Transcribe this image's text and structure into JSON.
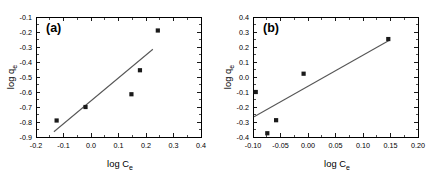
{
  "figure": {
    "background": "#ffffff",
    "panel_count": 2
  },
  "chart_data": [
    {
      "type": "scatter",
      "panel_label": "(a)",
      "title": "",
      "xlabel": "log C",
      "xlabel_sub": "e",
      "ylabel": "log q",
      "ylabel_sub": "e",
      "xlim": [
        -0.2,
        0.4
      ],
      "ylim": [
        -0.9,
        -0.1
      ],
      "xticks": [
        -0.2,
        -0.1,
        0.0,
        0.1,
        0.2,
        0.3,
        0.4
      ],
      "xticklabels": [
        "-0.2",
        "-0.1",
        "0.0",
        "0.1",
        "0.2",
        "0.3",
        "0.4"
      ],
      "yticks": [
        -0.9,
        -0.8,
        -0.7,
        -0.6,
        -0.5,
        -0.4,
        -0.3,
        -0.2,
        -0.1
      ],
      "yticklabels": [
        "-0.9",
        "-0.8",
        "-0.7",
        "-0.6",
        "-0.5",
        "-0.4",
        "-0.3",
        "-0.2",
        "-0.1"
      ],
      "grid": false,
      "legend": null,
      "marker_color": "#1a1a1a",
      "marker_shape": "square",
      "line_color": "#555555",
      "points": [
        {
          "x": -0.125,
          "y": -0.79
        },
        {
          "x": -0.02,
          "y": -0.7
        },
        {
          "x": 0.147,
          "y": -0.615
        },
        {
          "x": 0.178,
          "y": -0.455
        },
        {
          "x": 0.243,
          "y": -0.19
        }
      ],
      "fit_line": {
        "x1": -0.135,
        "y1": -0.865,
        "x2": 0.225,
        "y2": -0.315
      }
    },
    {
      "type": "scatter",
      "panel_label": "(b)",
      "title": "",
      "xlabel": "log C",
      "xlabel_sub": "e",
      "ylabel": "log q",
      "ylabel_sub": "e",
      "xlim": [
        -0.1,
        0.2
      ],
      "ylim": [
        -0.4,
        0.4
      ],
      "xticks": [
        -0.1,
        -0.05,
        0.0,
        0.05,
        0.1,
        0.15,
        0.2
      ],
      "xticklabels": [
        "-0.10",
        "-0.05",
        "0.00",
        "0.05",
        "0.10",
        "0.15",
        "0.20"
      ],
      "yticks": [
        -0.4,
        -0.3,
        -0.2,
        -0.1,
        0.0,
        0.1,
        0.2,
        0.3,
        0.4
      ],
      "yticklabels": [
        "-0.4",
        "-0.3",
        "-0.2",
        "-0.1",
        "0.0",
        "0.1",
        "0.2",
        "0.3",
        "0.4"
      ],
      "grid": false,
      "legend": null,
      "marker_color": "#1a1a1a",
      "marker_shape": "square",
      "line_color": "#555555",
      "points": [
        {
          "x": -0.095,
          "y": -0.1
        },
        {
          "x": -0.074,
          "y": -0.375
        },
        {
          "x": -0.058,
          "y": -0.288
        },
        {
          "x": -0.008,
          "y": 0.022
        },
        {
          "x": 0.146,
          "y": 0.253
        }
      ],
      "fit_line": {
        "x1": -0.098,
        "y1": -0.265,
        "x2": 0.148,
        "y2": 0.245
      }
    }
  ]
}
